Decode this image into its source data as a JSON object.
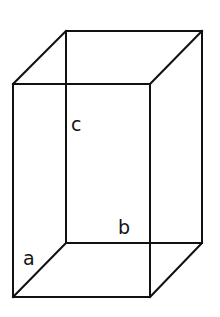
{
  "diagram": {
    "type": "rectangular-prism",
    "stroke_color": "#111111",
    "background_color": "#ffffff",
    "vertices": {
      "front_top_left": [
        13,
        84
      ],
      "front_top_right": [
        150,
        84
      ],
      "front_bottom_left": [
        13,
        297
      ],
      "front_bottom_right": [
        150,
        297
      ],
      "back_top_left": [
        66,
        31
      ],
      "back_top_right": [
        202,
        31
      ],
      "back_bottom_left": [
        66,
        243
      ],
      "back_bottom_right": [
        202,
        243
      ]
    },
    "labels": {
      "a": {
        "text": "a",
        "x": 23,
        "y": 265,
        "edge": "depth (front-bottom-left to back-bottom-left)"
      },
      "b": {
        "text": "b",
        "x": 118,
        "y": 234,
        "edge": "width (back-bottom edge)"
      },
      "c": {
        "text": "c",
        "x": 71,
        "y": 131,
        "edge": "height (back-left vertical edge)"
      }
    }
  }
}
